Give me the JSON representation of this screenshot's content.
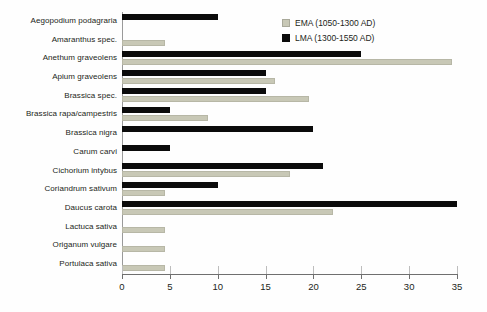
{
  "chart_data": {
    "type": "bar",
    "orientation": "horizontal",
    "title": "",
    "xlabel": "",
    "ylabel": "",
    "xlim": [
      0,
      35
    ],
    "xticks": [
      0,
      5,
      10,
      15,
      20,
      25,
      30,
      35
    ],
    "grid": false,
    "legend_position": "top-right",
    "categories": [
      "Aegopodium podagraria",
      "Amaranthus spec.",
      "Anethum graveolens",
      "Apium graveolens",
      "Brassica spec.",
      "Brassica rapa/campestris",
      "Brassica nigra",
      "Carum carvi",
      "Cichorium intybus",
      "Coriandrum sativum",
      "Daucus carota",
      "Lactuca sativa",
      "Origanum vulgare",
      "Portulaca sativa"
    ],
    "series": [
      {
        "name": "EMA (1050-1300 AD)",
        "color": "#c8c8b6",
        "values": [
          0,
          4.5,
          34.5,
          16,
          19.5,
          9,
          0,
          0,
          17.5,
          4.5,
          22,
          4.5,
          4.5,
          4.5
        ]
      },
      {
        "name": "LMA (1300-1550 AD)",
        "color": "#0b0b0b",
        "values": [
          10,
          0,
          25,
          15,
          15,
          5,
          20,
          5,
          21,
          10,
          35,
          0,
          0,
          0
        ]
      }
    ]
  },
  "legend": {
    "items": [
      {
        "label": "EMA (1050-1300 AD)",
        "swatch": "ema-swatch"
      },
      {
        "label": "LMA (1300-1550 AD)",
        "swatch": "lma-swatch"
      }
    ]
  },
  "axis": {
    "tick_labels": [
      "0",
      "5",
      "10",
      "15",
      "20",
      "25",
      "30",
      "35"
    ]
  }
}
